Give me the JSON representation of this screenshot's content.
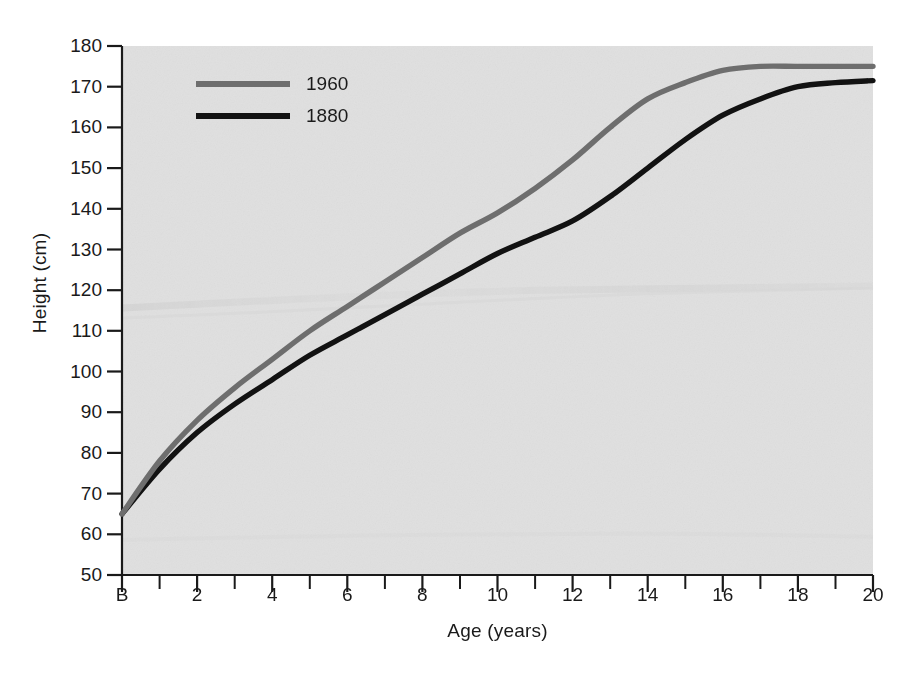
{
  "chart_data": {
    "type": "line",
    "title": "",
    "xlabel": "Age (years)",
    "ylabel": "Height (cm)",
    "xlim": [
      0,
      20
    ],
    "ylim": [
      50,
      180
    ],
    "grid": false,
    "legend_position": "top-left",
    "x_tick_labels": [
      "B",
      "2",
      "4",
      "6",
      "8",
      "10",
      "12",
      "14",
      "16",
      "18",
      "20"
    ],
    "x_tick_values": [
      0,
      2,
      4,
      6,
      8,
      10,
      12,
      14,
      16,
      18,
      20
    ],
    "x_minor_tick_values": [
      1,
      3,
      5,
      7,
      9,
      11,
      13,
      15,
      17,
      19
    ],
    "y_tick_labels": [
      "50",
      "60",
      "70",
      "80",
      "90",
      "100",
      "110",
      "120",
      "130",
      "140",
      "150",
      "160",
      "170",
      "180"
    ],
    "y_tick_values": [
      50,
      60,
      70,
      80,
      90,
      100,
      110,
      120,
      130,
      140,
      150,
      160,
      170,
      180
    ],
    "x": [
      0,
      1,
      2,
      3,
      4,
      5,
      6,
      7,
      8,
      9,
      10,
      11,
      12,
      13,
      14,
      15,
      16,
      17,
      18,
      19,
      20
    ],
    "series": [
      {
        "name": "1960",
        "color": "#6e6e6e",
        "values": [
          65,
          78,
          88,
          96,
          103,
          110,
          116,
          122,
          128,
          134,
          139,
          145,
          152,
          160,
          167,
          171,
          174,
          175,
          175,
          175,
          175
        ]
      },
      {
        "name": "1880",
        "color": "#121212",
        "values": [
          65,
          76,
          85,
          92,
          98,
          104,
          109,
          114,
          119,
          124,
          129,
          133,
          137,
          143,
          150,
          157,
          163,
          167,
          170,
          171,
          171.5
        ]
      }
    ],
    "legend": [
      {
        "label": "1960",
        "color": "#6e6e6e"
      },
      {
        "label": "1880",
        "color": "#121212"
      }
    ],
    "colors": {
      "plot_background": "#e0e0e0",
      "figure_background": "#ffffff",
      "axis": "#1a1a1a",
      "series_1960": "#6e6e6e",
      "series_1880": "#121212"
    }
  }
}
